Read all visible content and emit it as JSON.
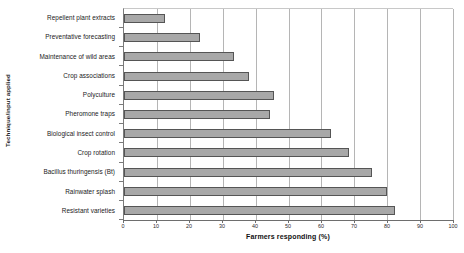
{
  "chart_data": {
    "type": "bar",
    "orientation": "horizontal",
    "title": "",
    "xlabel": "Farmers responding (%)",
    "ylabel": "Technique/input applied",
    "xlim": [
      0,
      100
    ],
    "xticks": [
      0,
      10,
      20,
      30,
      40,
      50,
      60,
      70,
      80,
      90,
      100
    ],
    "grid": "vertical",
    "legend": "none",
    "bar_fill_color": "#a8a8a8",
    "bar_border_color": "#555555",
    "gridline_color": "#b5b5b5",
    "categories": [
      "Repellent plant extracts",
      "Preventative forecasting",
      "Maintenance of wild areas",
      "Crop associations",
      "Polyculture",
      "Pheromone traps",
      "Biological insect control",
      "Crop rotation",
      "Bacillus thuringensis (Bt)",
      "Rainwater splash",
      "Resistant varieties"
    ],
    "values": [
      12.5,
      23,
      33.5,
      38,
      45.5,
      44.5,
      63,
      68.5,
      75.5,
      80,
      82.5
    ]
  }
}
